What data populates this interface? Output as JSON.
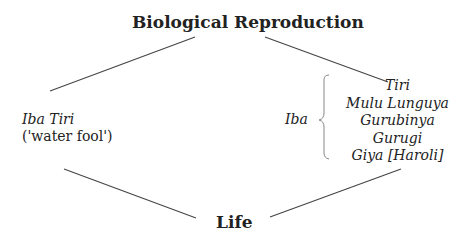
{
  "diagram": {
    "top": "Biological Reproduction",
    "bottom": "Life",
    "left": {
      "name": "Iba Tiri",
      "gloss": "('water fool')"
    },
    "right": {
      "group_label": "Iba",
      "items": [
        "Tiri",
        "Mulu Lunguya",
        "Gurubinya",
        "Gurugi",
        "Giya [Haroli]"
      ]
    }
  }
}
